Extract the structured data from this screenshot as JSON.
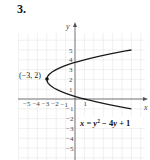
{
  "problem": {
    "number": "3."
  },
  "chart_data": {
    "type": "line",
    "title": "",
    "xlabel": "x",
    "ylabel": "y",
    "xlim": [
      -6,
      7
    ],
    "ylim": [
      -6,
      6
    ],
    "grid": true,
    "x_ticks": [
      "−5",
      "−4",
      "−3",
      "−2",
      "−1",
      "1"
    ],
    "y_ticks": [
      "5",
      "4",
      "3",
      "2",
      "1",
      "−1",
      "−2",
      "−3",
      "−4",
      "−5"
    ],
    "series": [
      {
        "name": "x = y² − 4y + 1",
        "equation": "x = y^2 - 4y + 1",
        "param_range_y": [
          -1,
          5
        ],
        "points": [
          {
            "x": 6,
            "y": -1
          },
          {
            "x": 1,
            "y": 0
          },
          {
            "x": -2,
            "y": 1
          },
          {
            "x": -3,
            "y": 2
          },
          {
            "x": -2,
            "y": 3
          },
          {
            "x": 1,
            "y": 4
          },
          {
            "x": 6,
            "y": 5
          }
        ]
      }
    ],
    "annotations": [
      {
        "label": "(−3, 2)",
        "x": -3,
        "y": 2,
        "type": "vertex-point"
      },
      {
        "label": "x = y² − 4y + 1",
        "type": "equation-label"
      }
    ]
  },
  "labels": {
    "vertex": "(−3, 2)",
    "eq_x": "x",
    "eq_mid": " = ",
    "eq_y": "y",
    "eq_sup": "2",
    "eq_rest": " − 4",
    "eq_y2": "y",
    "eq_end": " + 1",
    "axis_x": "x",
    "axis_y": "y"
  }
}
